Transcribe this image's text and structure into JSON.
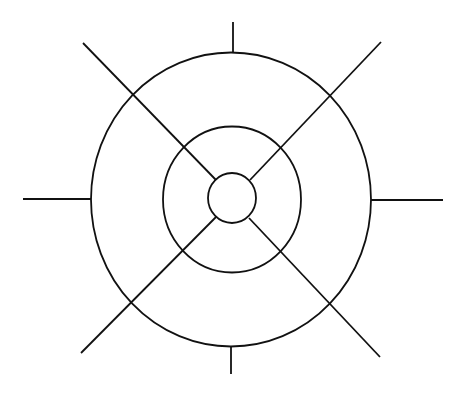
{
  "diagram": {
    "type": "concentric-circles-with-radial-spokes",
    "background": "#ffffff",
    "stroke_color": "#111111",
    "stroke_width": 1.8,
    "center": [
      232,
      199
    ],
    "circles": [
      {
        "name": "inner-circle",
        "cx": 232,
        "cy": 198,
        "rx": 24,
        "ry": 25
      },
      {
        "name": "middle-circle",
        "cx": 232,
        "cy": 199.5,
        "rx": 69,
        "ry": 73
      },
      {
        "name": "outer-circle",
        "cx": 231,
        "cy": 199.5,
        "rx": 140,
        "ry": 147
      }
    ],
    "diagonal_spokes": [
      {
        "name": "spoke-top-left",
        "x1": 83,
        "y1": 43,
        "x2": 216,
        "y2": 180
      },
      {
        "name": "spoke-top-right",
        "x1": 381,
        "y1": 42,
        "x2": 250,
        "y2": 180
      },
      {
        "name": "spoke-bottom-left",
        "x1": 81,
        "y1": 353,
        "x2": 216,
        "y2": 217
      },
      {
        "name": "spoke-bottom-right",
        "x1": 380,
        "y1": 357,
        "x2": 249,
        "y2": 218
      }
    ],
    "axis_ticks": [
      {
        "name": "tick-top",
        "x1": 233,
        "y1": 22,
        "x2": 233,
        "y2": 52
      },
      {
        "name": "tick-bottom",
        "x1": 231,
        "y1": 347,
        "x2": 231,
        "y2": 374
      },
      {
        "name": "tick-left",
        "x1": 23,
        "y1": 199,
        "x2": 91,
        "y2": 199
      },
      {
        "name": "tick-right",
        "x1": 371,
        "y1": 200,
        "x2": 443,
        "y2": 200
      }
    ]
  }
}
